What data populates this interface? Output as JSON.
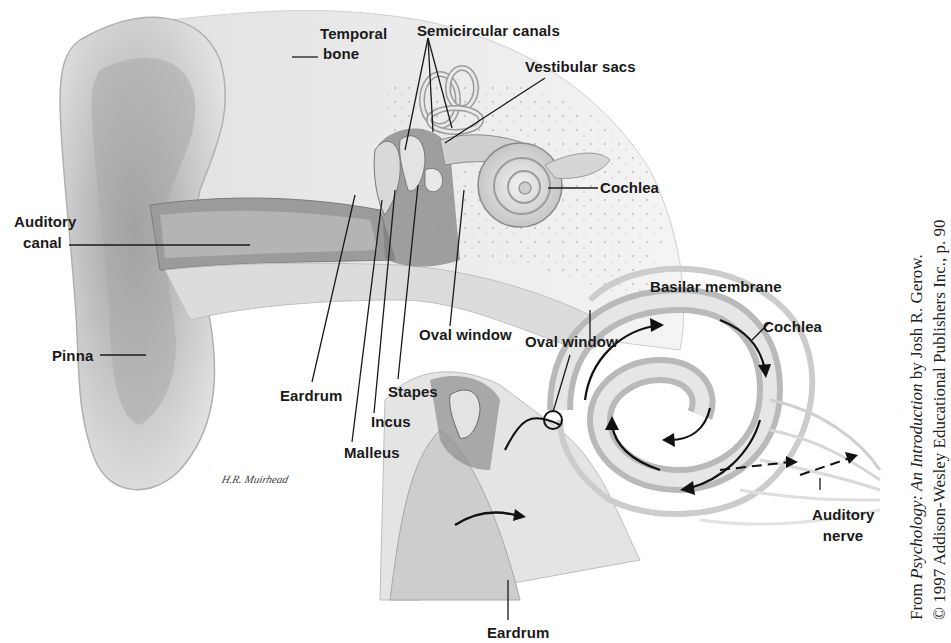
{
  "figure": {
    "upper_diagram": {
      "labels": {
        "temporal_bone_line1": "Temporal",
        "temporal_bone_line2": "bone",
        "semicircular_canals": "Semicircular canals",
        "vestibular_sacs": "Vestibular sacs",
        "cochlea": "Cochlea",
        "auditory_canal_line1": "Auditory",
        "auditory_canal_line2": "canal",
        "pinna": "Pinna",
        "oval_window": "Oval window",
        "eardrum": "Eardrum",
        "stapes": "Stapes",
        "incus": "Incus",
        "malleus": "Malleus"
      }
    },
    "lower_diagram": {
      "labels": {
        "basilar_membrane": "Basilar membrane",
        "oval_window": "Oval window",
        "cochlea": "Cochlea",
        "auditory_nerve_line1": "Auditory",
        "auditory_nerve_line2": "nerve",
        "eardrum": "Eardrum"
      }
    },
    "signature": "H.R. Muirhead",
    "credit": {
      "line1_prefix": "From ",
      "line1_title": "Psychology: An Introduction",
      "line1_suffix": " by Josh R. Gerow.",
      "line2": "© 1997 Addison-Wesley Educational Publishers Inc., p. 90"
    },
    "colors": {
      "background": "#ffffff",
      "label_text": "#1a1a1a",
      "tissue_light": "#e6e6e6",
      "tissue_mid": "#c9c9c9",
      "tissue_dark": "#8f8f8f",
      "leader_line": "#1a1a1a"
    }
  }
}
